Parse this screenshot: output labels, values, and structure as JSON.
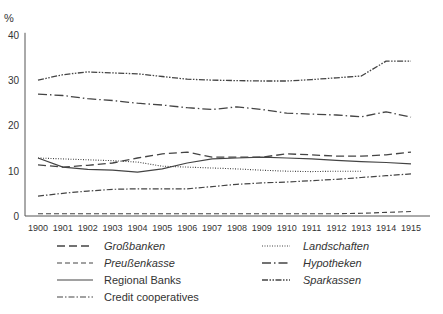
{
  "chart_data": {
    "type": "line",
    "title": "",
    "xlabel": "",
    "ylabel": "%",
    "ylim": [
      0,
      40
    ],
    "yticks": [
      0,
      10,
      20,
      30,
      40
    ],
    "grid": false,
    "legend_position": "bottom",
    "x": [
      "1900",
      "1901",
      "1902",
      "1903",
      "1904",
      "1905",
      "1906",
      "1907",
      "1908",
      "1909",
      "1910",
      "1911",
      "1912",
      "1913",
      "1914",
      "1915"
    ],
    "series": [
      {
        "name": "Großbanken",
        "italic": true,
        "dash": "8,4",
        "width": 1.3,
        "values": [
          11.3,
          10.8,
          11.2,
          11.7,
          12.8,
          13.7,
          14.1,
          13.0,
          13.0,
          13.0,
          13.7,
          13.5,
          13.2,
          13.2,
          13.5,
          14.1
        ]
      },
      {
        "name": "Preußenkasse",
        "italic": true,
        "dash": "5,3",
        "width": 1.1,
        "values": [
          0.5,
          0.5,
          0.5,
          0.5,
          0.5,
          0.5,
          0.5,
          0.5,
          0.5,
          0.5,
          0.5,
          0.5,
          0.5,
          0.6,
          0.8,
          1.0
        ]
      },
      {
        "name": "Regional Banks",
        "italic": false,
        "dash": "",
        "width": 1.2,
        "values": [
          12.8,
          10.8,
          10.3,
          10.1,
          9.7,
          10.4,
          11.7,
          12.6,
          12.8,
          13.0,
          12.8,
          12.6,
          12.3,
          12.0,
          11.8,
          11.5
        ]
      },
      {
        "name": "Credit cooperatives",
        "italic": false,
        "dash": "6,2,1.5,2",
        "width": 1.2,
        "values": [
          4.4,
          5.0,
          5.5,
          5.9,
          6.0,
          6.0,
          6.0,
          6.5,
          7.0,
          7.3,
          7.5,
          7.8,
          8.1,
          8.5,
          8.9,
          9.3
        ]
      },
      {
        "name": "Landschaften",
        "italic": true,
        "dash": "1,1.5",
        "width": 1.1,
        "values": [
          12.8,
          12.6,
          12.4,
          12.2,
          11.9,
          11.0,
          10.8,
          10.6,
          10.4,
          10.1,
          9.9,
          9.8,
          9.9,
          9.9,
          null,
          null
        ]
      },
      {
        "name": "Hypotheken",
        "italic": true,
        "dash": "9,3,1.5,3",
        "width": 1.3,
        "values": [
          26.9,
          26.6,
          25.9,
          25.5,
          24.9,
          24.5,
          23.9,
          23.5,
          24.1,
          23.5,
          22.7,
          22.5,
          22.3,
          21.9,
          23.0,
          21.8
        ]
      },
      {
        "name": "Sparkassen",
        "italic": true,
        "dash": "6,1.5,1.5,1.5,1.5,1.5",
        "width": 1.3,
        "values": [
          30.0,
          31.2,
          31.8,
          31.6,
          31.4,
          30.8,
          30.2,
          30.0,
          29.9,
          29.8,
          29.8,
          30.1,
          30.5,
          30.9,
          34.2,
          34.2
        ]
      }
    ]
  },
  "legend": {
    "left": [
      {
        "label": "Großbanken",
        "series_index": 0
      },
      {
        "label": "Preußenkasse",
        "series_index": 1
      },
      {
        "label": "Regional Banks",
        "series_index": 2
      },
      {
        "label": "Credit cooperatives",
        "series_index": 3
      }
    ],
    "right": [
      {
        "label": "Landschaften",
        "series_index": 4
      },
      {
        "label": "Hypotheken",
        "series_index": 5
      },
      {
        "label": "Sparkassen",
        "series_index": 6
      }
    ]
  },
  "style": {
    "line_color": "#444444",
    "axis_color": "#555555",
    "text_color": "#333333"
  }
}
